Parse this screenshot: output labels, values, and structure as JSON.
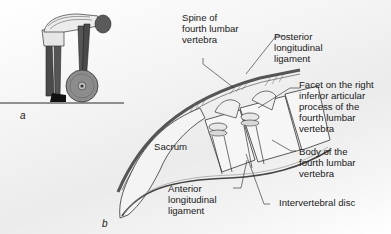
{
  "figure": {
    "panels": [
      {
        "id": "a",
        "letter": "a",
        "description": "Person bending forward lifting a weight plate"
      },
      {
        "id": "b",
        "letter": "b",
        "description": "Lateral section of lumbar spine and sacrum"
      }
    ],
    "labels": {
      "spine_of_l4": "Spine of\nfourth lumbar\nvertebra",
      "posterior_ligament": "Posterior\nlongitudinal\nligament",
      "facet": "Facet on the right\ninferior articular\nprocess of the\nfourth lumbar\nvertebra",
      "body_of_l4": "Body of the\nfourth lumbar\nvertebra",
      "intervertebral_disc": "Intervertebral disc",
      "sacrum": "Sacrum",
      "anterior_ligament": "Anterior\nlongitudinal\nligament"
    },
    "colors": {
      "outline": "#2a2a2a",
      "skin": "#5a5a5a",
      "shirt": "#e8e8e8",
      "weight": "#8a8a8a",
      "bone": "#f2f2f2",
      "ligament": "#6a6a6a"
    }
  }
}
